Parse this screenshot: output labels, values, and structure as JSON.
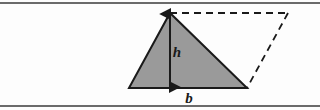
{
  "figure": {
    "background_color": "#fdfdfd",
    "frame": {
      "name": "horizontal-rules",
      "line_color": "#3a3a3a",
      "top_y": 3,
      "bottom_y": 106,
      "stroke_width": 1.6
    },
    "triangle": {
      "name": "shaded-triangle",
      "fill_color": "#9a9a9a",
      "stroke_color": "#1a1a1a",
      "stroke_width": 2,
      "points": "129,88 247,88 170,13",
      "vertices": [
        {
          "label": "base-left",
          "x": 129,
          "y": 88
        },
        {
          "label": "base-right",
          "x": 247,
          "y": 88
        },
        {
          "label": "apex",
          "x": 170,
          "y": 13
        }
      ]
    },
    "parallelogram": {
      "name": "dashed-completion",
      "stroke_color": "#1a1a1a",
      "stroke_width": 1.8,
      "dash_pattern": "7,5",
      "top_edge": {
        "x1": 170,
        "y1": 13,
        "x2": 288,
        "y2": 13
      },
      "right_edge": {
        "x1": 288,
        "y1": 13,
        "x2": 247,
        "y2": 88
      }
    },
    "height_arrow": {
      "name": "height-double-arrow",
      "stroke_color": "#1a1a1a",
      "stroke_width": 2,
      "x": 170,
      "y_top": 14,
      "y_bottom": 87,
      "arrowhead_style": "solid-triangle-both-ends"
    },
    "labels": {
      "height": {
        "text": "h",
        "x": 177,
        "y": 57,
        "font_size": 15
      },
      "base": {
        "text": "b",
        "x": 189,
        "y": 103,
        "font_size": 15
      }
    }
  }
}
